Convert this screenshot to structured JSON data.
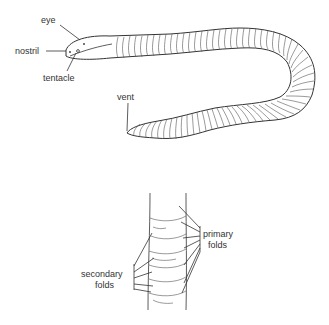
{
  "diagram": {
    "figures": [
      {
        "id": "whole-body",
        "labels": [
          {
            "key": "eye",
            "text": "eye"
          },
          {
            "key": "nostril",
            "text": "nostril"
          },
          {
            "key": "tentacle",
            "text": "tentacle"
          },
          {
            "key": "vent",
            "text": "vent"
          }
        ]
      },
      {
        "id": "body-section",
        "labels": [
          {
            "key": "primary",
            "text": "primary",
            "text2": "folds"
          },
          {
            "key": "secondary",
            "text": "secondary",
            "text2": "folds"
          }
        ]
      }
    ],
    "colors": {
      "line": "#333333",
      "background": "#ffffff"
    }
  }
}
